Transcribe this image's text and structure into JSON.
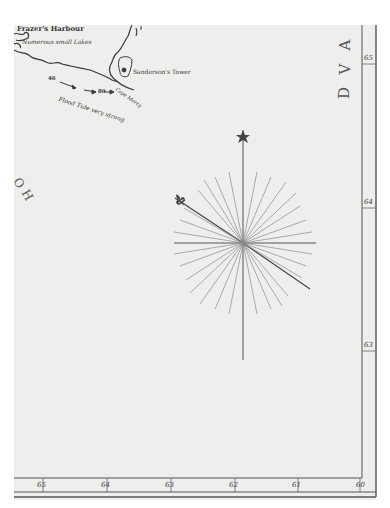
{
  "map": {
    "type": "historical nautical chart (scanned)",
    "colors": {
      "paper": "#eeeeec",
      "ink": "#3a3a3a",
      "border": "#555555",
      "rhumb_lines": "#8a8a8a"
    },
    "labels": {
      "harbour": "Frazer's Harbour",
      "lakes": "Numerous small Lakes",
      "tower": "Sanderson's Tower",
      "cape": "Cape Mercy",
      "tide": "Flood Tide very strong",
      "sounding_a": "46",
      "sounding_b": "80"
    },
    "sea_name_right": [
      "A",
      "V",
      "D"
    ],
    "sea_name_left": [
      "O",
      "H"
    ],
    "compass_rose": {
      "north_marker": "star",
      "fleur_de_lis": "north-west pointer",
      "rays": 32
    },
    "scales": {
      "right_latitude": [
        "65",
        "64",
        "63"
      ],
      "bottom_longitude": [
        "65",
        "64",
        "63",
        "62",
        "61",
        "60"
      ]
    }
  }
}
